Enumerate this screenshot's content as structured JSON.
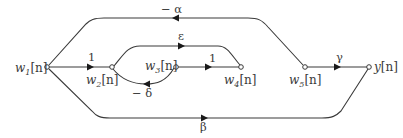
{
  "diagram": {
    "type": "signal-flow-graph",
    "colors": {
      "stroke": "#3a3a3a",
      "background": "#ffffff"
    },
    "nodes": [
      {
        "id": "w1",
        "name": "w",
        "sub": "1",
        "suffix": "[n]"
      },
      {
        "id": "w2",
        "name": "w",
        "sub": "2",
        "suffix": "[n]"
      },
      {
        "id": "w3",
        "name": "w",
        "sub": "3",
        "suffix": "[n]"
      },
      {
        "id": "w4",
        "name": "w",
        "sub": "4",
        "suffix": "[n]"
      },
      {
        "id": "w5",
        "name": "w",
        "sub": "5",
        "suffix": "[n]"
      },
      {
        "id": "y",
        "name": "y",
        "sub": "",
        "suffix": "[n]"
      }
    ],
    "edges": [
      {
        "from": "w1",
        "to": "w2",
        "gain": "1"
      },
      {
        "from": "w2",
        "to": "w4",
        "gain": "ε"
      },
      {
        "from": "w3",
        "to": "w4",
        "gain": "1"
      },
      {
        "from": "w3",
        "to": "w2",
        "gain": "− δ"
      },
      {
        "from": "y",
        "to": "w1",
        "gain": "− α"
      },
      {
        "from": "w5",
        "to": "y",
        "gain": "γ"
      },
      {
        "from": "w1",
        "to": "y",
        "gain": "β"
      }
    ]
  }
}
